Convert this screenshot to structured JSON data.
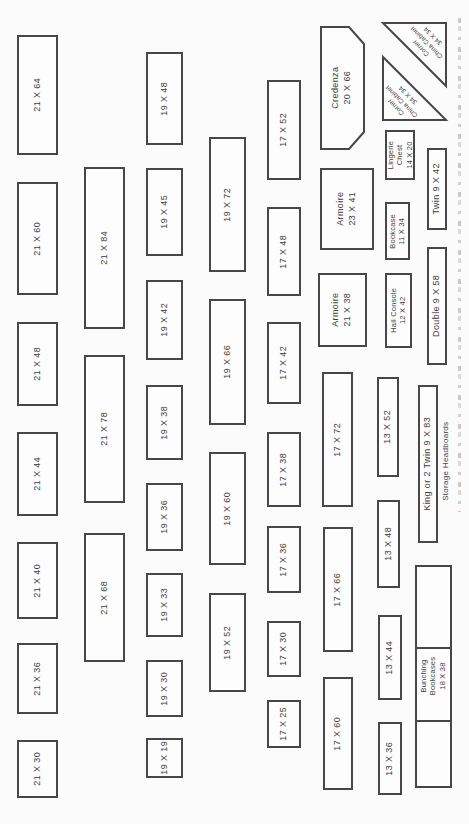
{
  "page": {
    "background": "#fbfbfb",
    "line_color": "#474747",
    "text_color": "#3e3e3e",
    "description_label": "Furniture template sheet (rotated page)"
  },
  "items": [
    {
      "name": "template-21x64",
      "label": "21 X 64",
      "shape": "rect",
      "x": 17,
      "y": 35,
      "w": 41,
      "h": 120
    },
    {
      "name": "template-21x60",
      "label": "21 X 60",
      "shape": "rect",
      "x": 17,
      "y": 182,
      "w": 41,
      "h": 113
    },
    {
      "name": "template-21x48",
      "label": "21 X 48",
      "shape": "rect",
      "x": 17,
      "y": 322,
      "w": 41,
      "h": 84
    },
    {
      "name": "template-21x44",
      "label": "21 X 44",
      "shape": "rect",
      "x": 17,
      "y": 432,
      "w": 41,
      "h": 84
    },
    {
      "name": "template-21x40",
      "label": "21 X 40",
      "shape": "rect",
      "x": 17,
      "y": 542,
      "w": 41,
      "h": 77
    },
    {
      "name": "template-21x36",
      "label": "21 X 36",
      "shape": "rect",
      "x": 17,
      "y": 643,
      "w": 41,
      "h": 71
    },
    {
      "name": "template-21x30",
      "label": "21 X 30",
      "shape": "rect",
      "x": 17,
      "y": 740,
      "w": 41,
      "h": 58
    },
    {
      "name": "template-21x84",
      "label": "21 X 84",
      "shape": "rect",
      "x": 84,
      "y": 167,
      "w": 41,
      "h": 162
    },
    {
      "name": "template-21x78",
      "label": "21 X 78",
      "shape": "rect",
      "x": 84,
      "y": 355,
      "w": 41,
      "h": 148
    },
    {
      "name": "template-21x68",
      "label": "21 X 68",
      "shape": "rect",
      "x": 84,
      "y": 533,
      "w": 41,
      "h": 129
    },
    {
      "name": "template-19x48",
      "label": "19 X 48",
      "shape": "rect",
      "x": 146,
      "y": 52,
      "w": 37,
      "h": 93
    },
    {
      "name": "template-19x45",
      "label": "19 X 45",
      "shape": "rect",
      "x": 146,
      "y": 168,
      "w": 37,
      "h": 88
    },
    {
      "name": "template-19x42",
      "label": "19 X 42",
      "shape": "rect",
      "x": 146,
      "y": 280,
      "w": 37,
      "h": 80
    },
    {
      "name": "template-19x38",
      "label": "19 X 38",
      "shape": "rect",
      "x": 146,
      "y": 385,
      "w": 37,
      "h": 75
    },
    {
      "name": "template-19x36",
      "label": "19 X 36",
      "shape": "rect",
      "x": 146,
      "y": 483,
      "w": 37,
      "h": 68
    },
    {
      "name": "template-19x33",
      "label": "19 X 33",
      "shape": "rect",
      "x": 146,
      "y": 573,
      "w": 37,
      "h": 64
    },
    {
      "name": "template-19x30",
      "label": "19 X 30",
      "shape": "rect",
      "x": 146,
      "y": 660,
      "w": 37,
      "h": 57
    },
    {
      "name": "template-19x19",
      "label": "19 X 19",
      "shape": "rect",
      "x": 146,
      "y": 738,
      "w": 37,
      "h": 40
    },
    {
      "name": "template-19x72",
      "label": "19 X 72",
      "shape": "rect",
      "x": 209,
      "y": 137,
      "w": 37,
      "h": 135
    },
    {
      "name": "template-19x66",
      "label": "19 X 66",
      "shape": "rect",
      "x": 209,
      "y": 299,
      "w": 37,
      "h": 126
    },
    {
      "name": "template-19x60",
      "label": "19 X 60",
      "shape": "rect",
      "x": 209,
      "y": 452,
      "w": 37,
      "h": 113
    },
    {
      "name": "template-19x52",
      "label": "19 X 52",
      "shape": "rect",
      "x": 209,
      "y": 593,
      "w": 37,
      "h": 99
    },
    {
      "name": "template-17x52",
      "label": "17 X 52",
      "shape": "rect",
      "x": 267,
      "y": 80,
      "w": 34,
      "h": 100
    },
    {
      "name": "template-17x48",
      "label": "17 X 48",
      "shape": "rect",
      "x": 267,
      "y": 207,
      "w": 34,
      "h": 89
    },
    {
      "name": "template-17x42",
      "label": "17 X 42",
      "shape": "rect",
      "x": 267,
      "y": 322,
      "w": 34,
      "h": 82
    },
    {
      "name": "template-17x38",
      "label": "17 X 38",
      "shape": "rect",
      "x": 267,
      "y": 432,
      "w": 34,
      "h": 75
    },
    {
      "name": "template-17x36",
      "label": "17 X 36",
      "shape": "rect",
      "x": 267,
      "y": 526,
      "w": 34,
      "h": 67
    },
    {
      "name": "template-17x30",
      "label": "17 X 30",
      "shape": "rect",
      "x": 267,
      "y": 621,
      "w": 34,
      "h": 56
    },
    {
      "name": "template-17x25",
      "label": "17 X 25",
      "shape": "rect",
      "x": 267,
      "y": 700,
      "w": 34,
      "h": 48
    },
    {
      "name": "template-credenza-20x66",
      "label": "Credenza\n20 X 66",
      "shape": "credenza",
      "x": 320,
      "y": 26,
      "w": 45,
      "h": 124
    },
    {
      "name": "template-armoire-23x41",
      "label": "Armoire\n23 X 41",
      "shape": "rect",
      "x": 320,
      "y": 168,
      "w": 54,
      "h": 82
    },
    {
      "name": "template-armoire-21x38",
      "label": "Armoire\n21 X 38",
      "shape": "rect",
      "x": 318,
      "y": 273,
      "w": 49,
      "h": 74
    },
    {
      "name": "template-17x72",
      "label": "17 X 72",
      "shape": "rect",
      "x": 322,
      "y": 372,
      "w": 31,
      "h": 135
    },
    {
      "name": "template-17x66",
      "label": "17 X 66",
      "shape": "rect",
      "x": 323,
      "y": 527,
      "w": 30,
      "h": 125
    },
    {
      "name": "template-17x60",
      "label": "17 X 60",
      "shape": "rect",
      "x": 323,
      "y": 677,
      "w": 30,
      "h": 113
    },
    {
      "name": "template-corner-china-cabinet-upper",
      "label": "Corner\nChina Cabinet\n34 X 34",
      "shape": "triangle-ne",
      "x": 382,
      "y": 22,
      "w": 65,
      "h": 65
    },
    {
      "name": "template-corner-china-cabinet-lower",
      "label": "Corner\nChina Cabinet\n34 X 34",
      "shape": "triangle-sw",
      "x": 382,
      "y": 56,
      "w": 65,
      "h": 65
    },
    {
      "name": "template-lingerie-chest-14x20",
      "label": "Lingerie\nChest\n14 X 20",
      "shape": "rect",
      "size": "sm",
      "x": 385,
      "y": 130,
      "w": 30,
      "h": 50
    },
    {
      "name": "template-twin-headboard-9x42",
      "label": "Twin 9 X 42",
      "shape": "rect",
      "x": 427,
      "y": 148,
      "w": 20,
      "h": 82
    },
    {
      "name": "template-bookcase-11x34",
      "label": "Bookcase\n11 X 34",
      "shape": "rect",
      "size": "sm",
      "x": 385,
      "y": 202,
      "w": 25,
      "h": 58
    },
    {
      "name": "template-double-headboard-9x58",
      "label": "Double 9 X 58",
      "shape": "rect",
      "x": 427,
      "y": 247,
      "w": 20,
      "h": 118
    },
    {
      "name": "template-hall-console-12x42",
      "label": "Hall Console\n12 X 42",
      "shape": "rect",
      "size": "sm",
      "x": 385,
      "y": 273,
      "w": 27,
      "h": 75
    },
    {
      "name": "template-13x52",
      "label": "13 X 52",
      "shape": "rect",
      "x": 377,
      "y": 377,
      "w": 22,
      "h": 100
    },
    {
      "name": "template-king-headboard-9x83",
      "label": "King or 2 Twin 9 X 83",
      "shape": "rect",
      "x": 418,
      "y": 385,
      "w": 20,
      "h": 158
    },
    {
      "name": "label-storage-headboards",
      "label": "Storage Headboards",
      "shape": "label",
      "x": 438,
      "y": 408,
      "w": 18,
      "h": 106
    },
    {
      "name": "template-13x48",
      "label": "13 X 48",
      "shape": "rect",
      "x": 377,
      "y": 500,
      "w": 23,
      "h": 88
    },
    {
      "name": "template-bunching-bookcases-18x38",
      "label": "Bunching\nBookcases\n18 X 38",
      "shape": "rect",
      "size": "sm",
      "x": 415,
      "y": 565,
      "w": 37,
      "h": 223,
      "dividers": [
        80,
        153
      ]
    },
    {
      "name": "template-13x44",
      "label": "13 X 44",
      "shape": "rect",
      "x": 378,
      "y": 615,
      "w": 24,
      "h": 85
    },
    {
      "name": "template-13x36",
      "label": "13 X 36",
      "shape": "rect",
      "x": 378,
      "y": 722,
      "w": 24,
      "h": 73
    }
  ]
}
